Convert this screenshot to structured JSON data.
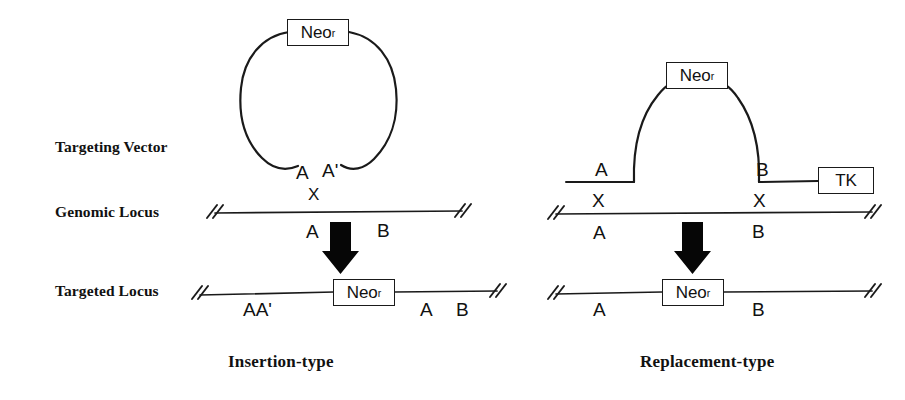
{
  "figure": {
    "title_caption_left": "Insertion-type",
    "title_caption_right": "Replacement-type",
    "row_labels": {
      "targeting_vector": "Targeting Vector",
      "genomic_locus": "Genomic Locus",
      "targeted_locus": "Targeted Locus"
    }
  },
  "gene_boxes": {
    "neo_label_text": "Neo",
    "neo_superscript": "r",
    "tk_label": "TK"
  },
  "left_panel": {
    "name": "Insertion-type",
    "vector": {
      "shape": "circle",
      "cassette": "Neo",
      "cassette_superscript": "r",
      "homology_arm_left": "A",
      "homology_arm_right": "A'",
      "crossover_mark": "X"
    },
    "genomic_locus": {
      "left_segment": "A",
      "right_segment": "B",
      "crossover_count": 1
    },
    "targeted_locus": {
      "duplicated_arm": "AA'",
      "cassette": "Neo",
      "cassette_superscript": "r",
      "downstream_left": "A",
      "downstream_right": "B"
    }
  },
  "right_panel": {
    "name": "Replacement-type",
    "vector": {
      "shape": "linear-with-arch",
      "cassette": "Neo",
      "cassette_superscript": "r",
      "homology_arm_left": "A",
      "homology_arm_right": "B",
      "negative_selection_marker": "TK",
      "crossover_mark_left": "X",
      "crossover_mark_right": "X"
    },
    "genomic_locus": {
      "left_segment": "A",
      "right_segment": "B",
      "crossover_count": 2
    },
    "targeted_locus": {
      "left_segment": "A",
      "cassette": "Neo",
      "cassette_superscript": "r",
      "right_segment": "B"
    }
  },
  "colors": {
    "ink": "#1a1a1a",
    "background": "#ffffff",
    "arrow_fill": "#060606"
  }
}
